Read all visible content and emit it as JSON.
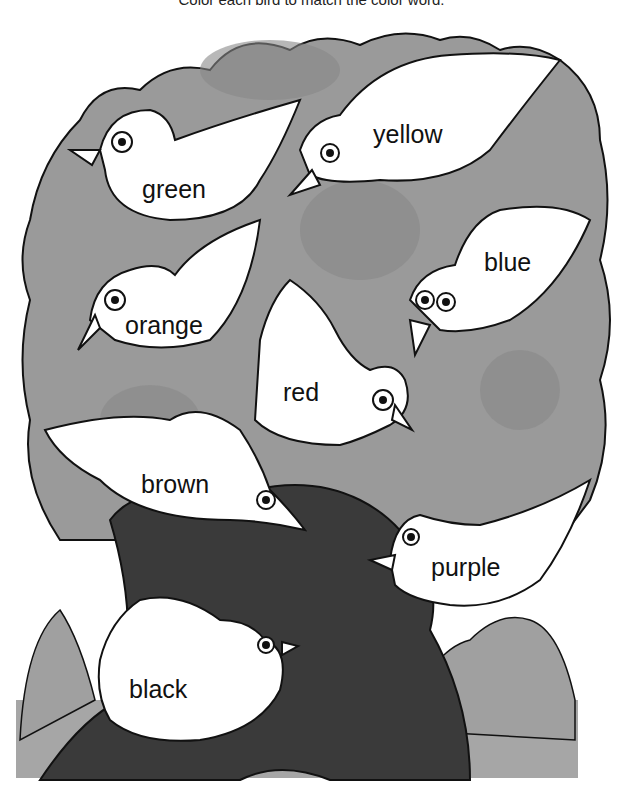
{
  "worksheet": {
    "instruction": "Color each bird to match the color word.",
    "colors": {
      "foliage": "#9a9a9a",
      "foliage_dark": "#8a8a8a",
      "trunk": "#3a3a3a",
      "ground": "#a6a6a6",
      "bird": "#ffffff",
      "outline": "#111111"
    },
    "birds": [
      {
        "label": "green",
        "x": 142,
        "y": 177
      },
      {
        "label": "yellow",
        "x": 373,
        "y": 122
      },
      {
        "label": "blue",
        "x": 484,
        "y": 250
      },
      {
        "label": "orange",
        "x": 125,
        "y": 313
      },
      {
        "label": "red",
        "x": 283,
        "y": 380
      },
      {
        "label": "brown",
        "x": 141,
        "y": 472
      },
      {
        "label": "purple",
        "x": 431,
        "y": 555
      },
      {
        "label": "black",
        "x": 129,
        "y": 677
      }
    ]
  }
}
